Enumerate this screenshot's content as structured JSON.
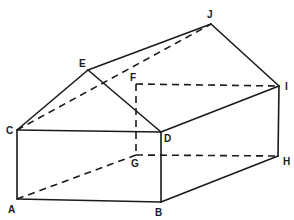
{
  "diagram": {
    "type": "3d-prism-wireframe",
    "vertices": {
      "A": {
        "x": 17,
        "y": 199,
        "label": "A",
        "lx": 8,
        "ly": 213
      },
      "B": {
        "x": 161,
        "y": 202,
        "label": "B",
        "lx": 155,
        "ly": 216
      },
      "C": {
        "x": 17,
        "y": 130,
        "label": "C",
        "lx": 6,
        "ly": 134
      },
      "D": {
        "x": 161,
        "y": 132,
        "label": "D",
        "lx": 164,
        "ly": 142
      },
      "E": {
        "x": 88,
        "y": 70,
        "label": "E",
        "lx": 79,
        "ly": 67
      },
      "F": {
        "x": 136,
        "y": 84,
        "label": "F",
        "lx": 130,
        "ly": 81
      },
      "G": {
        "x": 136,
        "y": 155,
        "label": "G",
        "lx": 131,
        "ly": 167
      },
      "H": {
        "x": 278,
        "y": 156,
        "label": "H",
        "lx": 283,
        "ly": 165
      },
      "I": {
        "x": 279,
        "y": 86,
        "label": "I",
        "lx": 285,
        "ly": 90
      },
      "J": {
        "x": 211,
        "y": 24,
        "label": "J",
        "lx": 207,
        "ly": 18
      }
    },
    "solid_edges": [
      [
        "C",
        "D"
      ],
      [
        "C",
        "A"
      ],
      [
        "A",
        "B"
      ],
      [
        "B",
        "D"
      ],
      [
        "B",
        "H"
      ],
      [
        "D",
        "I"
      ],
      [
        "I",
        "H"
      ],
      [
        "C",
        "E"
      ],
      [
        "E",
        "D"
      ],
      [
        "E",
        "J"
      ],
      [
        "J",
        "I"
      ]
    ],
    "dashed_edges": [
      [
        "C",
        "J"
      ],
      [
        "F",
        "I"
      ],
      [
        "F",
        "G"
      ],
      [
        "G",
        "A"
      ],
      [
        "G",
        "H"
      ]
    ]
  }
}
